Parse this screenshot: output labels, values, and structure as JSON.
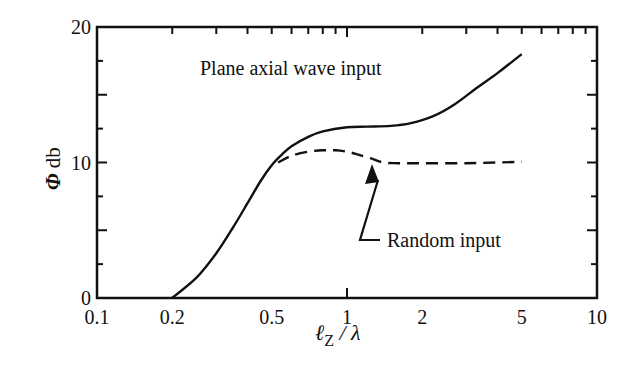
{
  "chart_data": {
    "type": "line",
    "title": "",
    "xlabel": "ℓZ / λ",
    "ylabel": "Φ db",
    "xscale": "log",
    "xlim": [
      0.1,
      10
    ],
    "ylim": [
      0,
      20
    ],
    "x_ticks": [
      "0.1",
      "0.2",
      "0.5",
      "1",
      "2",
      "5",
      "10"
    ],
    "x_tick_values": [
      0.1,
      0.2,
      0.5,
      1,
      2,
      5,
      10
    ],
    "y_ticks": [
      "0",
      "10",
      "20"
    ],
    "y_tick_values": [
      0,
      10,
      20
    ],
    "grid": false,
    "legend": null,
    "series": [
      {
        "name": "Plane axial wave input",
        "style": "solid",
        "x": [
          0.2,
          0.25,
          0.3,
          0.35,
          0.4,
          0.45,
          0.5,
          0.55,
          0.6,
          0.7,
          0.8,
          1.0,
          1.2,
          1.5,
          1.8,
          2.2,
          2.7,
          3.3,
          4.0,
          5.0
        ],
        "y": [
          0,
          1.5,
          3.3,
          5.2,
          7.0,
          8.6,
          9.8,
          10.6,
          11.2,
          11.9,
          12.3,
          12.6,
          12.65,
          12.7,
          12.9,
          13.4,
          14.3,
          15.5,
          16.6,
          18.0
        ]
      },
      {
        "name": "Random input",
        "style": "dashed",
        "x": [
          0.53,
          0.6,
          0.7,
          0.8,
          0.9,
          1.0,
          1.1,
          1.25,
          1.4,
          1.6,
          2.0,
          3.0,
          4.0,
          5.0
        ],
        "y": [
          10.0,
          10.5,
          10.8,
          10.9,
          10.9,
          10.8,
          10.6,
          10.3,
          10.0,
          9.95,
          9.95,
          9.95,
          10.0,
          10.05
        ]
      }
    ],
    "annotations": [
      {
        "text": "Plane axial wave input",
        "x": 0.55,
        "y": 18.5,
        "target": "solid curve"
      },
      {
        "text": "Random input",
        "x": 1.5,
        "y": 6.0,
        "arrow_to": {
          "x": 1.2,
          "y": 10.3
        }
      }
    ]
  },
  "labels": {
    "annotation_plane": "Plane axial wave input",
    "annotation_random": "Random input",
    "y_axis_phi": "Φ",
    "y_axis_unit": " db",
    "x_axis_l": "ℓ",
    "x_axis_sub": "Z",
    "x_axis_rest": " / λ"
  }
}
